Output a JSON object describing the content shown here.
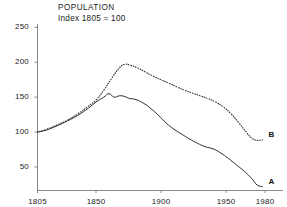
{
  "chart_data": {
    "type": "line",
    "title": "POPULATION",
    "subtitle": "Index  1805 = 100",
    "xlabel": "",
    "ylabel": "",
    "xlim": [
      1805,
      1980
    ],
    "ylim": [
      17,
      262
    ],
    "grid": false,
    "legend_position": "inline-right-end",
    "xticks": [
      1805,
      1850,
      1900,
      1950,
      1980
    ],
    "xtick_labels": [
      "1805",
      "1850",
      "1900",
      "1950",
      "1980"
    ],
    "yticks": [
      50,
      100,
      150,
      200,
      250
    ],
    "ytick_labels": [
      "50",
      "100",
      "150",
      "200",
      "250"
    ],
    "series": [
      {
        "name": "B",
        "label": "B",
        "style": "dotted",
        "color": "#3a3a3a",
        "x": [
          1805,
          1812,
          1820,
          1828,
          1836,
          1844,
          1850,
          1856,
          1862,
          1868,
          1872,
          1876,
          1882,
          1888,
          1894,
          1900,
          1906,
          1912,
          1918,
          1924,
          1930,
          1936,
          1942,
          1948,
          1954,
          1960,
          1966,
          1970,
          1974,
          1978
        ],
        "values": [
          100,
          104,
          110,
          117,
          126,
          137,
          146,
          160,
          177,
          192,
          197,
          196,
          192,
          186,
          180,
          175,
          170,
          165,
          160,
          156,
          152,
          148,
          143,
          136,
          126,
          113,
          99,
          91,
          88,
          89
        ]
      },
      {
        "name": "A",
        "label": "A",
        "style": "solid",
        "color": "#2b2b2b",
        "x": [
          1805,
          1812,
          1820,
          1828,
          1836,
          1844,
          1850,
          1856,
          1860,
          1864,
          1868,
          1872,
          1876,
          1880,
          1886,
          1892,
          1898,
          1904,
          1910,
          1916,
          1922,
          1928,
          1934,
          1940,
          1946,
          1952,
          1958,
          1964,
          1970,
          1974,
          1978
        ],
        "values": [
          100,
          103,
          109,
          116,
          124,
          134,
          143,
          150,
          155,
          150,
          152,
          151,
          148,
          147,
          142,
          134,
          124,
          113,
          104,
          97,
          90,
          84,
          79,
          76,
          70,
          62,
          53,
          44,
          33,
          24,
          22
        ]
      }
    ]
  },
  "labels": {
    "series_a": "A",
    "series_b": "B"
  }
}
